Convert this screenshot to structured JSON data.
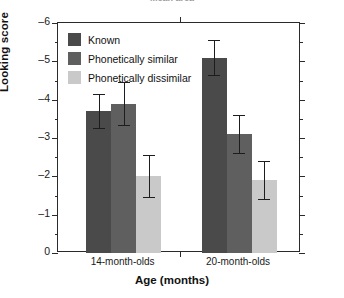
{
  "figure": {
    "title_clipped": "Mean area",
    "y_axis_label": "Looking score",
    "x_axis_label": "Age (months)"
  },
  "legend": {
    "position": "top-left",
    "items": [
      {
        "label": "Known",
        "color": "#4a4a4a"
      },
      {
        "label": "Phonetically similar",
        "color": "#5f5f5f"
      },
      {
        "label": "Phonetically dissimilar",
        "color": "#c9c9c9"
      }
    ]
  },
  "chart_data": {
    "type": "bar",
    "title": "",
    "xlabel": "Age (months)",
    "ylabel": "Looking score",
    "categories": [
      "14-month-olds",
      "20-month-olds"
    ],
    "series": [
      {
        "name": "Known",
        "color": "#4a4a4a",
        "values": [
          -3.7,
          -5.1
        ],
        "errors": [
          0.45,
          0.45
        ]
      },
      {
        "name": "Phonetically similar",
        "color": "#5f5f5f",
        "values": [
          -3.9,
          -3.1
        ],
        "errors": [
          0.55,
          0.5
        ]
      },
      {
        "name": "Phonetically dissimilar",
        "color": "#c9c9c9",
        "values": [
          -2.0,
          -1.9
        ],
        "errors": [
          0.55,
          0.5
        ]
      }
    ],
    "ylim": [
      0,
      -6
    ],
    "y_inverted": true,
    "y_ticks": [
      0,
      -1,
      -2,
      -3,
      -4,
      -5,
      -6
    ],
    "y_tick_labels": [
      "0",
      "-1",
      "-2",
      "-3",
      "-4",
      "-5",
      "-6"
    ],
    "y_minor_ticks": [
      -0.5,
      -1.5,
      -2.5,
      -3.5,
      -4.5,
      -5.5
    ],
    "grid": false,
    "error_bar_style": "symmetric-caps",
    "legend_position": "top-left"
  }
}
